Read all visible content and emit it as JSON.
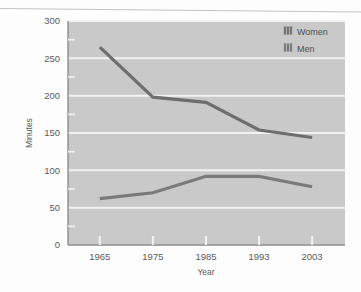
{
  "chart_data": {
    "type": "line",
    "title": "",
    "xlabel": "Year",
    "ylabel": "Minutes",
    "categories": [
      "1965",
      "1975",
      "1985",
      "1993",
      "2003"
    ],
    "series": [
      {
        "name": "Women",
        "values": [
          265,
          198,
          191,
          154,
          144
        ],
        "color": "#6e6e6e"
      },
      {
        "name": "Men",
        "values": [
          62,
          70,
          92,
          92,
          78
        ],
        "color": "#7a7a7a"
      }
    ],
    "ylim": [
      0,
      300
    ],
    "yticks": [
      0,
      50,
      100,
      150,
      200,
      250,
      300
    ],
    "ytick_labels": [
      "0",
      "50",
      "100",
      "150",
      "200",
      "250",
      "300"
    ],
    "yminor_step": 25,
    "grid": "horizontal-major-white",
    "legend_position": "top-right",
    "plot_background": "#c9c9c9"
  },
  "axes": {
    "y_axis_title": "Minutes",
    "x_axis_title": "Year",
    "y_tick_labels": [
      "300",
      "250",
      "200",
      "150",
      "100",
      "50",
      "0"
    ],
    "x_tick_labels": [
      "1965",
      "1975",
      "1985",
      "1993",
      "2003"
    ]
  },
  "legend": {
    "items": [
      {
        "label": "Women",
        "swatch": "legend-swatch-women"
      },
      {
        "label": "Men",
        "swatch": "legend-swatch-men"
      }
    ]
  },
  "colors": {
    "plot_bg": "#c9c9c9",
    "gridline": "#f2f2f2",
    "women_line": "#6e6e6e",
    "men_line": "#7a7a7a",
    "axis": "#8c8c8c",
    "text": "#5a5a5a"
  }
}
